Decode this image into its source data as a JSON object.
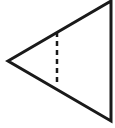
{
  "diagram": {
    "type": "geometry",
    "shape": "triangle",
    "colors": {
      "stroke": "#1a1a1a",
      "background": "#ffffff"
    },
    "triangle": {
      "vertices": {
        "left": [
          8,
          61
        ],
        "top_right": [
          111,
          1
        ],
        "bottom_right": [
          111,
          121
        ]
      },
      "stroke_width": 3
    },
    "dashed_segment": {
      "x": 57,
      "y1": 32,
      "y2": 82,
      "stroke_width": 2.5,
      "dash": "5,4"
    }
  }
}
